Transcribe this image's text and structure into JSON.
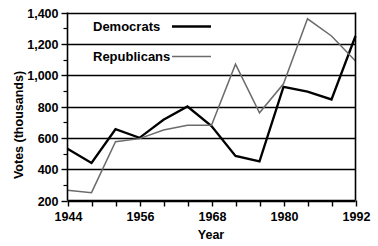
{
  "chart_data": {
    "type": "line",
    "title": "",
    "xlabel": "Year",
    "ylabel": "Votes (thousands)",
    "xlim": [
      1944,
      1992
    ],
    "ylim": [
      200,
      1400
    ],
    "grid": true,
    "legend_position": "inside-top-left",
    "x_tick_step": 4,
    "x_labeled_step": 12,
    "y_tick_step": 200,
    "y_minor_step": 100,
    "x_tick_labels": [
      "1944",
      "",
      "",
      "1956",
      "",
      "",
      "1968",
      "",
      "",
      "1980",
      "",
      "",
      "1992"
    ],
    "y_tick_labels": [
      "200",
      "400",
      "600",
      "800",
      "1,000",
      "1,200",
      "1,400"
    ],
    "x": [
      1944,
      1948,
      1952,
      1956,
      1960,
      1964,
      1968,
      1972,
      1976,
      1980,
      1984,
      1988,
      1992
    ],
    "series": [
      {
        "name": "Democrats",
        "color": "#000000",
        "width": 2.3,
        "values": [
          530,
          440,
          655,
          600,
          715,
          800,
          675,
          485,
          450,
          925,
          895,
          845,
          1250
        ]
      },
      {
        "name": "Republicans",
        "color": "#6b6b6b",
        "width": 1.5,
        "values": [
          265,
          250,
          575,
          595,
          650,
          680,
          680,
          1070,
          760,
          945,
          1360,
          1250,
          1090
        ]
      }
    ]
  },
  "legend": {
    "items": [
      {
        "label": "Democrats"
      },
      {
        "label": "Republicans"
      }
    ]
  },
  "axes": {
    "x_title": "Year",
    "y_title": "Votes (thousands)"
  },
  "colors": {
    "democrat": "#000000",
    "republican": "#6b6b6b",
    "axis": "#000000",
    "background": "#ffffff"
  }
}
